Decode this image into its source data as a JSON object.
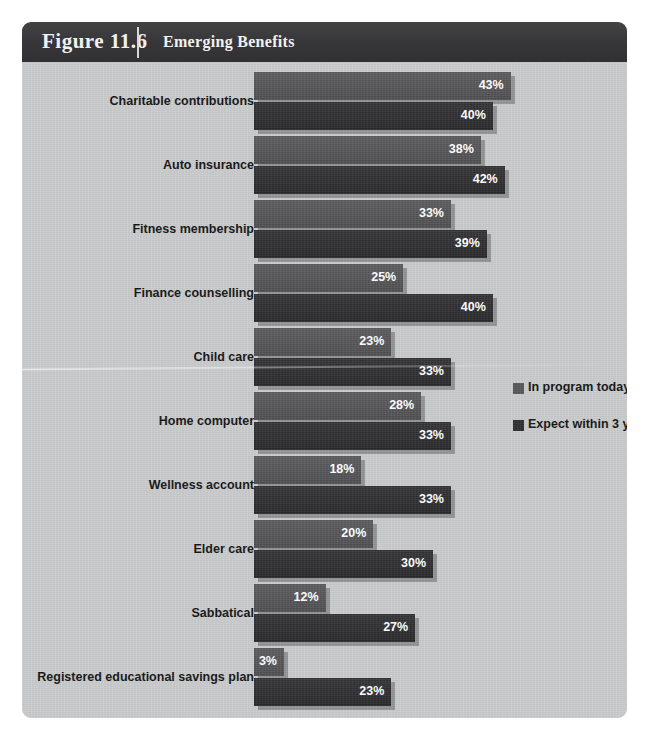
{
  "header": {
    "figure_number": "Figure 11.6",
    "title": "Emerging Benefits"
  },
  "colors": {
    "header_bg": "#3a3a3c",
    "panel_bg": "#c9cacb",
    "series_in_program": "#555558",
    "series_expect": "#2e2e31",
    "value_label": "#ffffff",
    "category_label": "#121212"
  },
  "legend": {
    "items": [
      {
        "label": "In program today",
        "color": "#555558"
      },
      {
        "label": "Expect within 3 years",
        "color": "#2e2e31"
      }
    ]
  },
  "chart_data": {
    "type": "bar",
    "orientation": "horizontal",
    "grouped": true,
    "title": "Emerging Benefits",
    "xlabel": "",
    "ylabel": "",
    "xlim": [
      0,
      45
    ],
    "grid": false,
    "legend_position": "middle-right",
    "value_format": "percent",
    "categories": [
      "Charitable contributions",
      "Auto insurance",
      "Fitness membership",
      "Finance counselling",
      "Child care",
      "Home computer",
      "Wellness account",
      "Elder care",
      "Sabbatical",
      "Registered educational savings plan"
    ],
    "series": [
      {
        "name": "In program today",
        "color": "#555558",
        "values": [
          43,
          38,
          33,
          25,
          23,
          28,
          18,
          20,
          12,
          3
        ],
        "labels": [
          "43%",
          "38%",
          "33%",
          "25%",
          "23%",
          "28%",
          "18%",
          "20%",
          "12%",
          "3%"
        ]
      },
      {
        "name": "Expect within 3 years",
        "color": "#2e2e31",
        "values": [
          40,
          42,
          39,
          40,
          33,
          33,
          33,
          30,
          27,
          23
        ],
        "labels": [
          "40%",
          "42%",
          "39%",
          "40%",
          "33%",
          "33%",
          "33%",
          "30%",
          "27%",
          "23%"
        ]
      }
    ]
  }
}
